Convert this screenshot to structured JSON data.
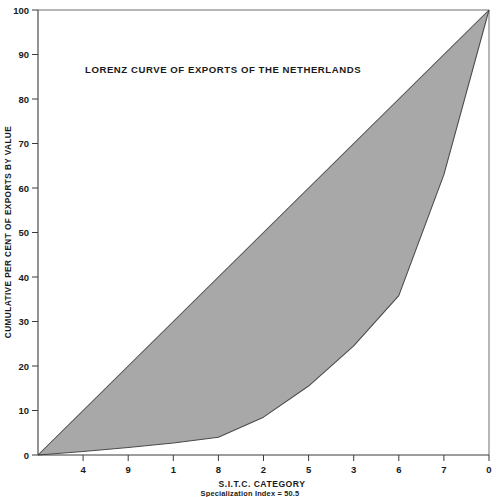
{
  "chart_data": {
    "type": "line",
    "title": "LORENZ CURVE OF EXPORTS OF THE NETHERLANDS",
    "xlabel": "S.I.T.C. CATEGORY",
    "ylabel": "CUMULATIVE PER CENT OF EXPORTS BY VALUE",
    "annotation": "Specialization Index = 50.5",
    "grid": false,
    "legend": "none",
    "xlim": [
      0,
      100
    ],
    "ylim": [
      0,
      100
    ],
    "categories": [
      "4",
      "9",
      "1",
      "8",
      "2",
      "5",
      "3",
      "6",
      "7",
      "0"
    ],
    "category_axis_note": "S.I.T.C. categories ordered from smallest to largest export share; each tick is one decile of categories (10% of category count).",
    "y_ticks": [
      0,
      10,
      20,
      30,
      40,
      50,
      60,
      70,
      80,
      90,
      100
    ],
    "x_tick_positions_percent": [
      10,
      20,
      30,
      40,
      50,
      60,
      70,
      80,
      90,
      100
    ],
    "series": [
      {
        "name": "Lorenz curve (cumulative per cent of exports by value)",
        "x": [
          0,
          10,
          20,
          30,
          40,
          50,
          60,
          70,
          80,
          90,
          100
        ],
        "values": [
          0,
          0.8,
          1.7,
          2.7,
          4.0,
          8.5,
          15.5,
          24.5,
          35.8,
          63.0,
          100.0
        ]
      },
      {
        "name": "Line of equality",
        "x": [
          0,
          100
        ],
        "values": [
          0,
          100
        ]
      }
    ],
    "shaded_area": {
      "label": "Area of concentration between line of equality and Lorenz curve",
      "color": "#a8a8a8"
    },
    "colors": {
      "fill": "#a8a8a8",
      "curve_stroke": "#4a4a4a",
      "axis": "#3b3b3b",
      "frame": "#6e6e6e",
      "text": "#1a1a1a",
      "background": "#ffffff"
    }
  },
  "axis_labels": {
    "y_0": "0",
    "y_10": "10",
    "y_20": "20",
    "y_30": "30",
    "y_40": "40",
    "y_50": "50",
    "y_60": "60",
    "y_70": "70",
    "y_80": "80",
    "y_90": "90",
    "y_100": "100",
    "x_1": "4",
    "x_2": "9",
    "x_3": "1",
    "x_4": "8",
    "x_5": "2",
    "x_6": "5",
    "x_7": "3",
    "x_8": "6",
    "x_9": "7",
    "x_10": "0"
  }
}
